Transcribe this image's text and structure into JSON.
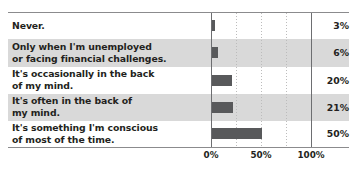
{
  "chart_data": {
    "type": "bar",
    "orientation": "horizontal",
    "title": "",
    "xlabel": "",
    "ylabel": "",
    "xlim": [
      0,
      100
    ],
    "xticks": [
      "0%",
      "50%",
      "100%"
    ],
    "xtick_values": [
      0,
      50,
      100
    ],
    "minor_gridlines": [
      25,
      50,
      75
    ],
    "grid": true,
    "legend": "none",
    "bar_color": "#58595b",
    "band_color": "#d9d9d9",
    "categories": [
      "Never.",
      "Only when I'm unemployed or facing financial challenges.",
      "It's occasionally in the back of my mind.",
      "It's often in the back of my mind.",
      "It's something I'm conscious of most of the time."
    ],
    "values": [
      3,
      6,
      20,
      21,
      50
    ],
    "value_labels": [
      "3%",
      "6%",
      "20%",
      "21%",
      "50%"
    ]
  },
  "rows": [
    {
      "lines": [
        "Never."
      ],
      "value": "3%",
      "pct": 3,
      "banded": false
    },
    {
      "lines": [
        "Only when I'm unemployed",
        "or facing financial challenges."
      ],
      "value": "6%",
      "pct": 6,
      "banded": true
    },
    {
      "lines": [
        "It's occasionally in the back",
        "of my mind."
      ],
      "value": "20%",
      "pct": 20,
      "banded": false
    },
    {
      "lines": [
        "It's often in the back of",
        "my mind."
      ],
      "value": "21%",
      "pct": 21,
      "banded": true
    },
    {
      "lines": [
        "It's something I'm conscious",
        "of most of the time."
      ],
      "value": "50%",
      "pct": 50,
      "banded": false
    }
  ],
  "axis": {
    "ticks": [
      {
        "label": "0%",
        "value": 0
      },
      {
        "label": "50%",
        "value": 50
      },
      {
        "label": "100%",
        "value": 100
      }
    ]
  }
}
